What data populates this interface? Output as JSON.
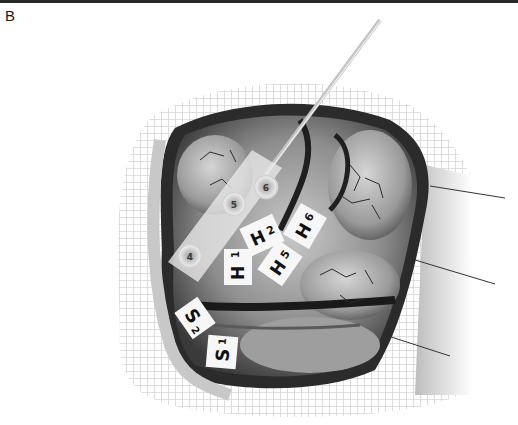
{
  "figure": {
    "panel_label": "B",
    "palette": {
      "background": "#ffffff",
      "mesh": "#d8d8d8",
      "tissue_light": "#bdbdbd",
      "tissue_dark": "#2b2b2b",
      "label_bg": "#f7f7f7",
      "label_text": "#111111"
    }
  },
  "electrode_strip": {
    "contacts": [
      {
        "number": "4"
      },
      {
        "number": "5"
      },
      {
        "number": "6"
      }
    ]
  },
  "labels": {
    "H1": {
      "letter": "H",
      "sub": "1"
    },
    "H2": {
      "letter": "H",
      "sub": "2"
    },
    "H5": {
      "letter": "H",
      "sub": "5"
    },
    "H6": {
      "letter": "H",
      "sub": "6"
    },
    "S1": {
      "letter": "S",
      "sub": "1"
    },
    "S2": {
      "letter": "S",
      "sub": "2"
    }
  }
}
